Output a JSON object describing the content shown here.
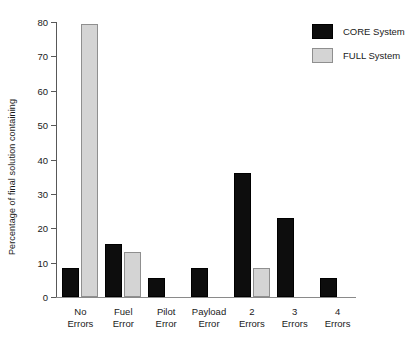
{
  "chart_data": {
    "type": "bar",
    "title": "",
    "xlabel": "",
    "ylabel": "Percentage of final solution containing",
    "ylim": [
      0,
      80
    ],
    "yticks": [
      0,
      10,
      20,
      30,
      40,
      50,
      60,
      70,
      80
    ],
    "ytick_labels": [
      "0",
      "10",
      "20",
      "30",
      "40",
      "50",
      "60",
      "70",
      "80"
    ],
    "grid": false,
    "legend_position": "top-right",
    "categories": [
      "No\nErrors",
      "Fuel\nError",
      "Pilot\nError",
      "Payload\nError",
      "2\nErrors",
      "3\nErrors",
      "4\nErrors"
    ],
    "category_lines": [
      [
        "No",
        "Errors"
      ],
      [
        "Fuel",
        "Error"
      ],
      [
        "Pilot",
        "Error"
      ],
      [
        "Payload",
        "Error"
      ],
      [
        "2",
        "Errors"
      ],
      [
        "3",
        "Errors"
      ],
      [
        "4",
        "Errors"
      ]
    ],
    "series": [
      {
        "name": "CORE System",
        "color": "#0d0d0d",
        "values": [
          8.5,
          15.5,
          5.5,
          8.5,
          36,
          23,
          5.5
        ]
      },
      {
        "name": "FULL System",
        "color": "#d4d4d4",
        "values": [
          79.5,
          13,
          0,
          0,
          8.5,
          0,
          0
        ]
      }
    ]
  },
  "legend": {
    "entries": [
      {
        "label": "CORE System",
        "swatch": "core"
      },
      {
        "label": "FULL System",
        "swatch": "full"
      }
    ]
  }
}
